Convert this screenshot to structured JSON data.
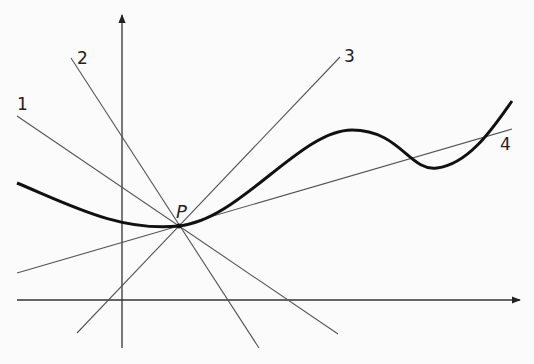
{
  "diagram": {
    "title": "",
    "point_label": "P",
    "point": {
      "x": 179,
      "y": 226
    },
    "axes": {
      "x_axis": {
        "y": 300,
        "x_start": 17,
        "x_end": 520
      },
      "y_axis": {
        "x": 122,
        "y_start": 348,
        "y_end": 15
      }
    },
    "lines": [
      {
        "label": "1",
        "x1": 17,
        "y1": 116,
        "x2": 338,
        "y2": 334,
        "label_x": 17,
        "label_y": 110
      },
      {
        "label": "2",
        "x1": 71,
        "y1": 58,
        "x2": 259,
        "y2": 348,
        "label_x": 77,
        "label_y": 64
      },
      {
        "label": "3",
        "x1": 340,
        "y1": 57,
        "x2": 77,
        "y2": 333,
        "label_x": 344,
        "label_y": 62
      },
      {
        "label": "4",
        "x1": 17,
        "y1": 273,
        "x2": 512,
        "y2": 129,
        "label_x": 500,
        "label_y": 150
      }
    ],
    "curve_path": "M17,183 C70,205 120,232 179,226 C240,220 300,130 352,130 C400,130 410,172 437,168 C470,164 495,125 512,101",
    "colors": {
      "curve": "#111111",
      "lines": "#555555",
      "axes": "#333333",
      "background": "#fbfbfb"
    }
  }
}
